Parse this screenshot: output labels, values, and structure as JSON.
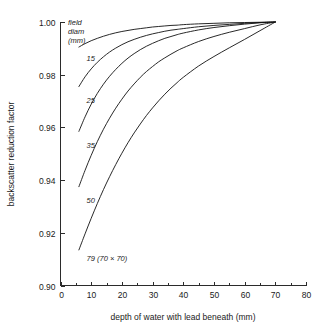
{
  "chart_data": {
    "type": "line",
    "title": "",
    "xlabel": "depth of water with lead beneath (mm)",
    "ylabel": "backscatter reduction factor",
    "xlim": [
      0,
      80
    ],
    "ylim": [
      0.9,
      1.0
    ],
    "grid": false,
    "legend_position": "inline-curve-labels",
    "legend_header": [
      "field",
      "diam",
      "(mm)"
    ],
    "x_ticks": [
      0,
      10,
      20,
      30,
      40,
      50,
      60,
      70,
      80
    ],
    "x_tick_labels": [
      "0",
      "10",
      "20",
      "30",
      "40",
      "50",
      "60",
      "70",
      "80"
    ],
    "x_minor_ticks": [
      5,
      15,
      25,
      35,
      45,
      55,
      65,
      75
    ],
    "y_ticks": [
      0.9,
      0.92,
      0.94,
      0.96,
      0.98,
      1.0
    ],
    "y_tick_labels": [
      "0.90",
      "0.92",
      "0.94",
      "0.96",
      "0.98",
      "1.00"
    ],
    "x": [
      6,
      8,
      10,
      12,
      14,
      16,
      18,
      20,
      22,
      24,
      26,
      28,
      30,
      32,
      34,
      36,
      38,
      40,
      45,
      50,
      55,
      60,
      65,
      70
    ],
    "series": [
      {
        "name": "15",
        "label": "15",
        "label_x": 8.5,
        "label_y": 0.9865,
        "values": [
          0.9905,
          0.9918,
          0.9929,
          0.9938,
          0.9946,
          0.9953,
          0.9959,
          0.9964,
          0.9968,
          0.9972,
          0.9975,
          0.9978,
          0.9981,
          0.9983,
          0.9985,
          0.9987,
          0.9988,
          0.999,
          0.9993,
          0.9995,
          0.9997,
          0.9998,
          0.9999,
          1.0
        ]
      },
      {
        "name": "25",
        "label": "25",
        "label_x": 8.5,
        "label_y": 0.9705,
        "values": [
          0.9755,
          0.9792,
          0.9822,
          0.9847,
          0.9868,
          0.9886,
          0.9901,
          0.9914,
          0.9925,
          0.9934,
          0.9942,
          0.9949,
          0.9955,
          0.996,
          0.9965,
          0.9969,
          0.9972,
          0.9975,
          0.9982,
          0.9987,
          0.9991,
          0.9995,
          0.9998,
          1.0
        ]
      },
      {
        "name": "35",
        "label": "35",
        "label_x": 8.5,
        "label_y": 0.9535,
        "values": [
          0.9585,
          0.964,
          0.9688,
          0.9729,
          0.9764,
          0.9794,
          0.982,
          0.9843,
          0.9863,
          0.988,
          0.9895,
          0.9908,
          0.9919,
          0.9929,
          0.9938,
          0.9945,
          0.9952,
          0.9958,
          0.997,
          0.9979,
          0.9986,
          0.9992,
          0.9997,
          1.0
        ]
      },
      {
        "name": "50",
        "label": "50",
        "label_x": 8.5,
        "label_y": 0.9325,
        "values": [
          0.9375,
          0.9437,
          0.9494,
          0.9546,
          0.9593,
          0.9635,
          0.9673,
          0.9707,
          0.9738,
          0.9765,
          0.979,
          0.9812,
          0.9831,
          0.9849,
          0.9864,
          0.9878,
          0.9891,
          0.9902,
          0.9926,
          0.9945,
          0.9961,
          0.9975,
          0.9989,
          1.0
        ]
      },
      {
        "name": "79",
        "label": "79 (70 × 70)",
        "label_x": 8.5,
        "label_y": 0.9105,
        "values": [
          0.9135,
          0.9196,
          0.9255,
          0.9311,
          0.9364,
          0.9413,
          0.9459,
          0.9502,
          0.9542,
          0.9579,
          0.9613,
          0.9645,
          0.9674,
          0.9701,
          0.9726,
          0.9749,
          0.977,
          0.979,
          0.9833,
          0.9869,
          0.9902,
          0.9934,
          0.9967,
          1.0
        ]
      }
    ]
  },
  "colors": {
    "curve": "#111111",
    "axis": "#2b2b2b",
    "background": "#ffffff"
  }
}
